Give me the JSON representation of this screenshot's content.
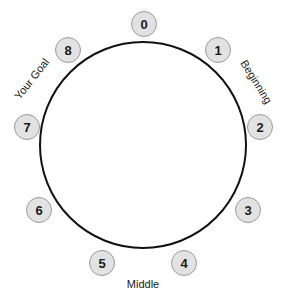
{
  "diagram": {
    "type": "circular-step-diagram",
    "background_color": "#ffffff",
    "circle": {
      "name": "main-circle",
      "center_x": 143,
      "center_y": 145,
      "radius": 103,
      "stroke_color": "#111111",
      "stroke_width": 2,
      "fill": "none"
    },
    "badge_style": {
      "fill_color": "#e2e2e2",
      "border_color": "#9a9a9a",
      "text_color": "#1a1a1a",
      "radius": 13
    },
    "steps": [
      {
        "label": "0",
        "x": 144,
        "y": 24
      },
      {
        "label": "1",
        "x": 218,
        "y": 50
      },
      {
        "label": "2",
        "x": 260,
        "y": 127
      },
      {
        "label": "3",
        "x": 248,
        "y": 210
      },
      {
        "label": "4",
        "x": 184,
        "y": 263
      },
      {
        "label": "5",
        "x": 102,
        "y": 263
      },
      {
        "label": "6",
        "x": 39,
        "y": 210
      },
      {
        "label": "7",
        "x": 27,
        "y": 127
      },
      {
        "label": "8",
        "x": 68,
        "y": 50
      }
    ],
    "labels": {
      "beginning": "Beginning",
      "middle": "Middle",
      "your_goal": "Your Goal"
    }
  },
  "chart_data": {
    "type": "scatter",
    "title": "",
    "xlabel": "",
    "ylabel": "",
    "annotations": [
      "Beginning",
      "Middle",
      "Your Goal"
    ],
    "categories": [
      "0",
      "1",
      "2",
      "3",
      "4",
      "5",
      "6",
      "7",
      "8"
    ],
    "values": [
      0,
      1,
      2,
      3,
      4,
      5,
      6,
      7,
      8
    ],
    "grid": false,
    "legend": "none"
  }
}
